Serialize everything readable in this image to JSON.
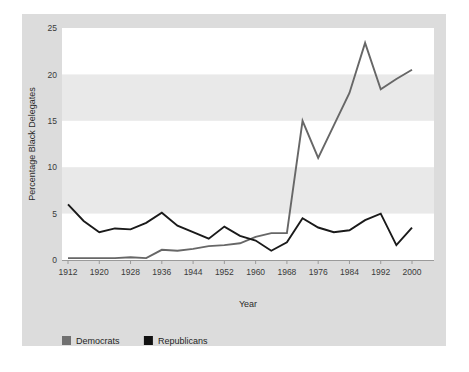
{
  "figure": {
    "top_caption_fragment": "",
    "panel_bg": "#dcdcdc",
    "band_color": "#e9e9e9",
    "plot_bg": "#ffffff"
  },
  "chart_data": {
    "type": "line",
    "title": "",
    "xlabel": "Year",
    "ylabel": "Percentage Black Delegates",
    "xlim": [
      1912,
      2000
    ],
    "ylim": [
      0,
      25
    ],
    "yticks": [
      0,
      5,
      10,
      15,
      20,
      25
    ],
    "xticks": [
      1912,
      1920,
      1928,
      1936,
      1944,
      1952,
      1960,
      1968,
      1976,
      1984,
      1992,
      2000
    ],
    "grid": "horizontal-bands",
    "legend_position": "bottom-left",
    "x": [
      1912,
      1916,
      1920,
      1924,
      1928,
      1932,
      1936,
      1940,
      1944,
      1948,
      1952,
      1956,
      1960,
      1964,
      1968,
      1972,
      1976,
      1980,
      1984,
      1988,
      1992,
      1996,
      2000
    ],
    "series": [
      {
        "name": "Democrats",
        "color": "#676767",
        "values": [
          0.2,
          0.2,
          0.2,
          0.2,
          0.3,
          0.2,
          1.1,
          1.0,
          1.2,
          1.5,
          1.6,
          1.8,
          2.5,
          2.9,
          2.9,
          15.0,
          11.0,
          14.5,
          18.0,
          23.4,
          18.4,
          19.5,
          20.5
        ]
      },
      {
        "name": "Republicans",
        "color": "#1a1a1a",
        "values": [
          6.0,
          4.2,
          3.0,
          3.4,
          3.3,
          4.0,
          5.1,
          3.7,
          3.0,
          2.3,
          3.6,
          2.6,
          2.1,
          1.0,
          1.9,
          4.5,
          3.5,
          3.0,
          3.2,
          4.3,
          5.0,
          1.6,
          3.5
        ]
      }
    ]
  },
  "legend": {
    "items": [
      {
        "label": "Democrats",
        "swatch": "#707070"
      },
      {
        "label": "Republicans",
        "swatch": "#111111"
      }
    ]
  }
}
